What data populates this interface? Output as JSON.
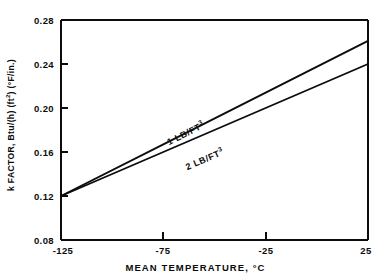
{
  "figure": {
    "width": 391,
    "height": 279,
    "background": "#ffffff",
    "ink_color": "#0c0c0c"
  },
  "axes": {
    "x_title": "MEAN TEMPERATURE, °C",
    "y_title_main": "k FACTOR, Btu/(h) (ft",
    "y_title_sup1": "2",
    "y_title_mid": ") (°F/in.)",
    "y_title_full": "k FACTOR, Btu/(h) (ft2) (°F/in.)",
    "x_ticks": [
      "-125",
      "-75",
      "-25",
      "25"
    ],
    "y_ticks": [
      "0.28",
      "0.24",
      "0.20",
      "0.16",
      "0.12",
      "0.08"
    ]
  },
  "series_labels": {
    "upper_prefix": "1 LB/FT",
    "upper_sup": "3",
    "upper_full": "1 LB/FT3",
    "lower_prefix": "2 LB/FT",
    "lower_sup": "3",
    "lower_full": "2 LB/FT3"
  },
  "chart_data": {
    "type": "line",
    "title": "",
    "subtitle": "",
    "xlabel": "MEAN TEMPERATURE, °C",
    "ylabel": "k FACTOR, Btu/(h) (ft2) (°F/in.)",
    "xlim": [
      -125,
      25
    ],
    "ylim": [
      0.08,
      0.28
    ],
    "xticks": [
      -125,
      -75,
      -25,
      25
    ],
    "yticks": [
      0.08,
      0.12,
      0.16,
      0.2,
      0.24,
      0.28
    ],
    "grid": false,
    "legend": "inline-annotations",
    "legend_position": "on-curve",
    "series": [
      {
        "name": "1 LB/FT3",
        "label": "1 LB/FT3",
        "x": [
          -125,
          -75,
          -25,
          25
        ],
        "values": [
          0.12,
          0.167,
          0.214,
          0.261
        ],
        "annotation": {
          "text": "1 LB/FT3",
          "x": -60,
          "y": 0.183
        }
      },
      {
        "name": "2 LB/FT3",
        "label": "2 LB/FT3",
        "x": [
          -125,
          -75,
          -25,
          25
        ],
        "values": [
          0.12,
          0.16,
          0.2,
          0.24
        ],
        "annotation": {
          "text": "2 LB/FT3",
          "x": -50,
          "y": 0.164
        }
      }
    ]
  }
}
